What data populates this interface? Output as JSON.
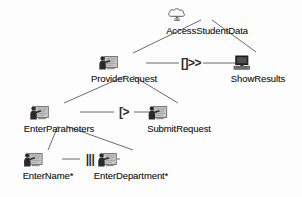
{
  "diagram": {
    "notation": "ConcurTaskTrees",
    "background_color": "#fdfdfd",
    "line_color": "#6b6b6b",
    "text_color": "#1a1a1a"
  },
  "nodes": [
    {
      "id": "access-student-data",
      "label": "AccessStudentData",
      "icon": "cloud-icon",
      "icon_type": "abstract-task",
      "x": 207,
      "y": 7,
      "label_x": 207
    },
    {
      "id": "provide-request",
      "label": "ProvideRequest",
      "icon": "user-interaction-icon",
      "icon_type": "interaction-task",
      "x": 131,
      "y": 55,
      "label_x": 124
    },
    {
      "id": "show-results",
      "label": "ShowResults",
      "icon": "monitor-icon",
      "icon_type": "application-task",
      "x": 258,
      "y": 55,
      "label_x": 258
    },
    {
      "id": "enter-parameters",
      "label": "EnterParameters",
      "icon": "user-interaction-icon",
      "icon_type": "interaction-task",
      "x": 64,
      "y": 105,
      "label_x": 59
    },
    {
      "id": "submit-request",
      "label": "SubmitRequest",
      "icon": "user-interaction-icon",
      "icon_type": "interaction-task",
      "x": 179,
      "y": 105,
      "label_x": 179
    },
    {
      "id": "enter-name",
      "label": "EnterName*",
      "icon": "user-interaction-icon",
      "icon_type": "interaction-task",
      "x": 48,
      "y": 152,
      "label_x": 48
    },
    {
      "id": "enter-department",
      "label": "EnterDepartment*",
      "icon": "user-interaction-icon",
      "icon_type": "interaction-task",
      "x": 134,
      "y": 152,
      "label_x": 131
    }
  ],
  "operators": [
    {
      "id": "op-enabling",
      "symbol": "[]>>",
      "name": "enabling",
      "x": 191,
      "y": 63,
      "left_x": 146,
      "right_x": 244
    },
    {
      "id": "op-disabling",
      "symbol": "[>",
      "name": "disabling",
      "x": 124,
      "y": 112,
      "left_x": 80,
      "right_x": 166
    },
    {
      "id": "op-interleaving",
      "symbol": "|||",
      "name": "interleaving",
      "x": 90,
      "y": 159,
      "left_x": 62,
      "right_x": 120
    }
  ],
  "edges": [
    {
      "id": "edge-asd-pr",
      "from": "access-student-data",
      "to": "provide-request",
      "x1": 201,
      "y1": 20,
      "x2": 133,
      "y2": 53
    },
    {
      "id": "edge-asd-sr",
      "from": "access-student-data",
      "to": "show-results",
      "x1": 212,
      "y1": 20,
      "x2": 256,
      "y2": 52
    },
    {
      "id": "edge-pr-ep",
      "from": "provide-request",
      "to": "enter-parameters",
      "x1": 125,
      "y1": 76,
      "x2": 64,
      "y2": 103
    },
    {
      "id": "edge-pr-sr2",
      "from": "provide-request",
      "to": "submit-request",
      "x1": 133,
      "y1": 76,
      "x2": 178,
      "y2": 103
    },
    {
      "id": "edge-ep-en",
      "from": "enter-parameters",
      "to": "enter-name",
      "x1": 58,
      "y1": 126,
      "x2": 48,
      "y2": 150
    },
    {
      "id": "edge-ep-ed",
      "from": "enter-parameters",
      "to": "enter-department",
      "x1": 66,
      "y1": 126,
      "x2": 133,
      "y2": 150
    }
  ]
}
